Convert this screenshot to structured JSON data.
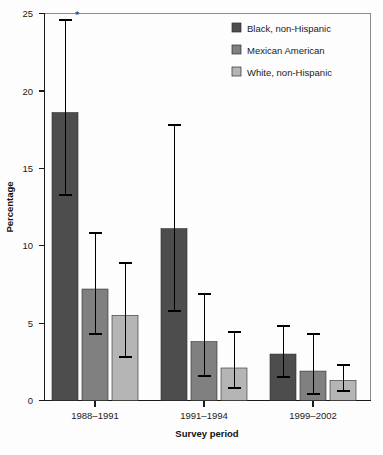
{
  "chart_data": {
    "type": "bar",
    "title": "",
    "subtitle": "",
    "xlabel": "Survey period",
    "ylabel": "Percentage",
    "categories": [
      "1988–1991",
      "1991–1994",
      "1999–2002"
    ],
    "ylim": [
      0,
      25
    ],
    "yticks": [
      0,
      5,
      10,
      15,
      20,
      25
    ],
    "ytick_labels": [
      "0",
      "5",
      "10",
      "15",
      "20",
      "25"
    ],
    "grid": false,
    "legend_position": "top-right",
    "error_bars": "95% confidence interval",
    "annotations": [
      {
        "text": "*",
        "category": "1988–1991",
        "series": "Black, non-Hispanic",
        "note": "asterisk above upper error bar cap"
      }
    ],
    "series": [
      {
        "name": "Black, non-Hispanic",
        "color": "#4d4d4d",
        "values": [
          18.6,
          11.1,
          3.0
        ],
        "err_low": [
          13.3,
          5.8,
          1.5
        ],
        "err_high": [
          24.6,
          17.8,
          4.8
        ]
      },
      {
        "name": "Mexican American",
        "color": "#808080",
        "values": [
          7.2,
          3.8,
          1.9
        ],
        "err_low": [
          4.3,
          1.6,
          0.4
        ],
        "err_high": [
          10.8,
          6.9,
          4.3
        ]
      },
      {
        "name": "White, non-Hispanic",
        "color": "#b5b5b5",
        "values": [
          5.5,
          2.1,
          1.3
        ],
        "err_low": [
          2.8,
          0.8,
          0.6
        ],
        "err_high": [
          8.9,
          4.4,
          2.3
        ]
      }
    ]
  },
  "legend": {
    "items": [
      {
        "label": "Black, non-Hispanic",
        "color": "#4d4d4d"
      },
      {
        "label": "Mexican American",
        "color": "#808080"
      },
      {
        "label": "White, non-Hispanic",
        "color": "#b5b5b5"
      }
    ]
  },
  "axes": {
    "y_title": "Percentage",
    "x_title": "Survey period",
    "y_tick_labels": [
      "25",
      "20",
      "15",
      "10",
      "5",
      "0"
    ],
    "x_tick_labels": [
      "1988–1991",
      "1991–1994",
      "1999–2002"
    ]
  }
}
